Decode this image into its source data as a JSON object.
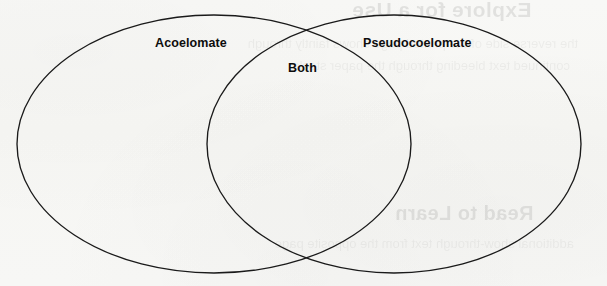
{
  "diagram": {
    "type": "venn",
    "title": "",
    "background_color": "#f7f7f4",
    "stroke_color": "#1a1a1a",
    "text_color": "#0d0d0d",
    "sets": [
      {
        "id": "left",
        "label": "Acoelomate",
        "region": "left-only",
        "center_x": 214,
        "center_y": 144,
        "radius_x": 197,
        "radius_y": 129
      },
      {
        "id": "right",
        "label": "Pseudocoelomate",
        "region": "right-only",
        "center_x": 394,
        "center_y": 144,
        "radius_x": 187,
        "radius_y": 129
      }
    ],
    "intersection": {
      "id": "both",
      "label": "Both",
      "region": "overlap"
    }
  },
  "showthrough": {
    "top": "Explore for a Use",
    "middle": "Read to Learn",
    "line_a": "the reverse side of the printed page shows faintly through",
    "line_b": "continued text bleeding through the paper stock",
    "line_c": "additional show-through text from the opposite page"
  }
}
